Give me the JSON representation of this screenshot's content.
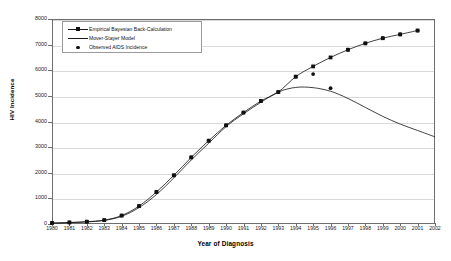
{
  "chart_data": {
    "type": "line",
    "title": "",
    "xlabel": "Year of Diagnosis",
    "ylabel": "HIV Incidence",
    "xlim": [
      1980,
      2002
    ],
    "ylim": [
      0,
      8000
    ],
    "ytick_step": 1000,
    "grid": true,
    "legend_position": "top-left",
    "x": [
      1980,
      1981,
      1982,
      1983,
      1984,
      1985,
      1986,
      1987,
      1988,
      1989,
      1990,
      1991,
      1992,
      1993,
      1994,
      1995,
      1996,
      1997,
      1998,
      1999,
      2000,
      2001,
      2002
    ],
    "xticklabels": [
      "1980",
      "1981",
      "1982",
      "1983",
      "1984",
      "1985",
      "1986",
      "1987",
      "1988",
      "1989",
      "1990",
      "1991",
      "1992",
      "1993",
      "1994",
      "1995",
      "1996",
      "1997",
      "1998",
      "1999",
      "2000",
      "2001",
      "2002"
    ],
    "yticklabels": [
      "0",
      "1000",
      "2000",
      "3000",
      "4000",
      "5000",
      "6000",
      "7000",
      "8000"
    ],
    "series": [
      {
        "name": "Empirical Bayesian Back-Calculation",
        "marker": "square",
        "line": true,
        "color": "#111111",
        "values": [
          40,
          60,
          90,
          150,
          330,
          700,
          1250,
          1900,
          2600,
          3250,
          3850,
          4350,
          4800,
          5150,
          5750,
          6150,
          6500,
          6800,
          7050,
          7250,
          7400,
          7550,
          null
        ]
      },
      {
        "name": "Mover-Stayer Model",
        "marker": "none",
        "line": true,
        "color": "#111111",
        "values": [
          30,
          50,
          80,
          140,
          300,
          640,
          1150,
          1800,
          2500,
          3150,
          3800,
          4300,
          4750,
          5150,
          5330,
          5320,
          5180,
          4900,
          4550,
          4200,
          3900,
          3650,
          3400
        ]
      },
      {
        "name": "Observed AIDS Incidence",
        "marker": "dot",
        "line": false,
        "color": "#111111",
        "values": [
          40,
          60,
          90,
          150,
          330,
          700,
          1250,
          1900,
          2600,
          3250,
          3850,
          4350,
          4800,
          5150,
          5750,
          5850,
          5300,
          6800,
          7050,
          7250,
          7400,
          7550,
          null
        ]
      }
    ]
  },
  "legend": {
    "items": [
      {
        "label": "Empirical Bayesian Back-Calculation",
        "key": "line-square"
      },
      {
        "label": "Mover-Stayer Model",
        "key": "line"
      },
      {
        "label": "Observed AIDS Incidence",
        "key": "dot"
      }
    ]
  }
}
